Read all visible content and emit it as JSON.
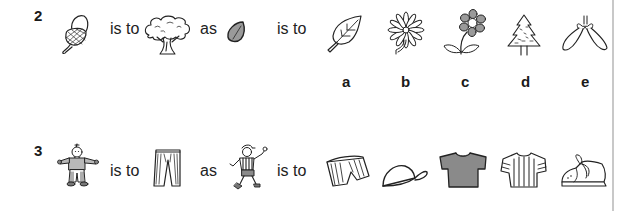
{
  "questions": [
    {
      "number": "2",
      "prompt": {
        "item1": "acorn-icon",
        "relation1": "is to",
        "item2": "oak-tree-icon",
        "connector": "as",
        "item3": "seed-icon",
        "relation2": "is to"
      },
      "options": [
        {
          "label": "a",
          "icon": "leaf-icon"
        },
        {
          "label": "b",
          "icon": "daisy-icon"
        },
        {
          "label": "c",
          "icon": "flower-icon"
        },
        {
          "label": "d",
          "icon": "fir-tree-icon"
        },
        {
          "label": "e",
          "icon": "sycamore-seed-icon"
        }
      ]
    },
    {
      "number": "3",
      "prompt": {
        "item1": "clown-icon",
        "relation1": "is to",
        "item2": "striped-trousers-icon",
        "connector": "as",
        "item3": "footballer-icon",
        "relation2": "is to"
      },
      "options": [
        {
          "label": "",
          "icon": "striped-shorts-icon"
        },
        {
          "label": "",
          "icon": "cap-icon"
        },
        {
          "label": "",
          "icon": "gray-tshirt-icon"
        },
        {
          "label": "",
          "icon": "striped-shirt-icon"
        },
        {
          "label": "",
          "icon": "shoe-icon"
        }
      ]
    }
  ],
  "colors": {
    "ink": "#1a1a1a",
    "fill_gray": "#8a8a8a",
    "rule": "#c8c8c8"
  }
}
